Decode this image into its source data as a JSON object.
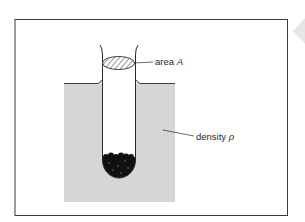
{
  "diagram": {
    "type": "hydrometer-in-liquid",
    "labels": {
      "area_prefix": "area ",
      "area_symbol": "A",
      "density_prefix": "density ",
      "density_symbol": "ρ"
    },
    "colors": {
      "liquid": "#d6d6d6",
      "frame": "#3a3a3a",
      "tube": "#2a2a2a",
      "ballast": "#111111",
      "hatch": "#333333"
    }
  },
  "side_nav": {
    "icon": "triangle-left-icon"
  }
}
